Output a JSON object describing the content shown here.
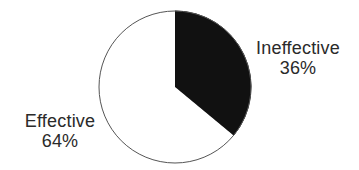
{
  "chart_data": {
    "type": "pie",
    "title": "",
    "slices": [
      {
        "label": "Ineffective",
        "value": 36,
        "display": "36%",
        "color": "#111111"
      },
      {
        "label": "Effective",
        "value": 64,
        "display": "64%",
        "color": "#ffffff"
      }
    ],
    "start_angle_deg": 0,
    "direction": "clockwise",
    "outline_color": "#555555"
  }
}
